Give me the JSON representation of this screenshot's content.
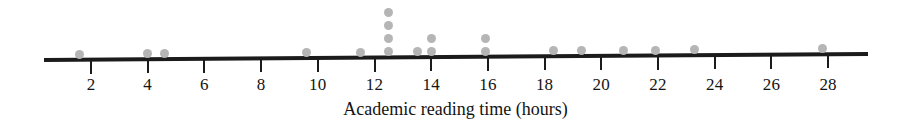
{
  "chart_data": {
    "type": "dotplot",
    "title": "",
    "xlabel": "Academic reading time (hours)",
    "ylabel": "",
    "xlim": [
      0.2,
      29.6
    ],
    "grid": false,
    "legend": null,
    "tick_labels": [
      "2",
      "4",
      "6",
      "8",
      "10",
      "12",
      "14",
      "16",
      "18",
      "20",
      "22",
      "24",
      "26",
      "28"
    ],
    "tick_values": [
      2,
      4,
      6,
      8,
      10,
      12,
      14,
      16,
      18,
      20,
      22,
      24,
      26,
      28
    ],
    "dot_color": "#b5b5b5",
    "axis_color": "#1b1b1b",
    "x": [
      1.6,
      4.0,
      4.6,
      9.6,
      11.5,
      12.5,
      12.5,
      12.5,
      12.5,
      13.5,
      14.0,
      14.0,
      15.9,
      15.9,
      18.3,
      19.3,
      20.8,
      21.9,
      23.3,
      27.8
    ],
    "counts": [
      {
        "value": 1.6,
        "count": 1
      },
      {
        "value": 4.0,
        "count": 1
      },
      {
        "value": 4.6,
        "count": 1
      },
      {
        "value": 9.6,
        "count": 1
      },
      {
        "value": 11.5,
        "count": 1
      },
      {
        "value": 12.5,
        "count": 4
      },
      {
        "value": 13.5,
        "count": 1
      },
      {
        "value": 14.0,
        "count": 2
      },
      {
        "value": 15.9,
        "count": 2
      },
      {
        "value": 18.3,
        "count": 1
      },
      {
        "value": 19.3,
        "count": 1
      },
      {
        "value": 20.8,
        "count": 1
      },
      {
        "value": 21.9,
        "count": 1
      },
      {
        "value": 23.3,
        "count": 1
      },
      {
        "value": 27.8,
        "count": 1
      }
    ],
    "total_points": 20
  },
  "layout": {
    "axis_y": 58,
    "axis_left_x": 44,
    "axis_right_x": 868,
    "axis_left_y": 60,
    "axis_right_y": 54,
    "axis_thickness": 4,
    "tick_top": 59,
    "tick_height": 13,
    "tick_label_y": 76,
    "axis_title_y": 99,
    "dot_diameter": 9,
    "dot_baseline_y": 48,
    "dot_spacing_y": 13,
    "unit_px": 28.35,
    "origin_value": 2,
    "origin_px": 91
  }
}
